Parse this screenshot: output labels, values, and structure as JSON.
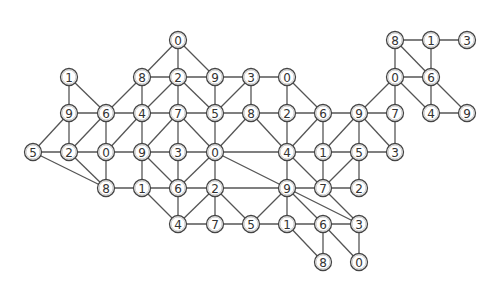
{
  "diagram": {
    "type": "graph",
    "grid": {
      "cols_x": [
        33,
        69,
        106,
        142,
        178,
        215,
        251,
        287,
        323,
        359,
        395,
        431,
        467
      ],
      "rows_y": [
        40,
        77,
        113,
        152,
        188,
        224,
        262
      ]
    },
    "colors": {
      "edge": "#555555",
      "node_stroke": "#444444",
      "node_fill": "#ffffff",
      "label": "#333333"
    },
    "nodes": [
      {
        "id": "r0c4",
        "r": 0,
        "c": 4,
        "label": "0"
      },
      {
        "id": "r0c10",
        "r": 0,
        "c": 10,
        "label": "8"
      },
      {
        "id": "r0c11",
        "r": 0,
        "c": 11,
        "label": "1"
      },
      {
        "id": "r0c12",
        "r": 0,
        "c": 12,
        "label": "3"
      },
      {
        "id": "r1c1",
        "r": 1,
        "c": 1,
        "label": "1"
      },
      {
        "id": "r1c3",
        "r": 1,
        "c": 3,
        "label": "8"
      },
      {
        "id": "r1c4",
        "r": 1,
        "c": 4,
        "label": "2"
      },
      {
        "id": "r1c5",
        "r": 1,
        "c": 5,
        "label": "9"
      },
      {
        "id": "r1c6",
        "r": 1,
        "c": 6,
        "label": "3"
      },
      {
        "id": "r1c7",
        "r": 1,
        "c": 7,
        "label": "0"
      },
      {
        "id": "r1c10",
        "r": 1,
        "c": 10,
        "label": "0"
      },
      {
        "id": "r1c11",
        "r": 1,
        "c": 11,
        "label": "6"
      },
      {
        "id": "r2c1",
        "r": 2,
        "c": 1,
        "label": "9"
      },
      {
        "id": "r2c2",
        "r": 2,
        "c": 2,
        "label": "6"
      },
      {
        "id": "r2c3",
        "r": 2,
        "c": 3,
        "label": "4"
      },
      {
        "id": "r2c4",
        "r": 2,
        "c": 4,
        "label": "7"
      },
      {
        "id": "r2c5",
        "r": 2,
        "c": 5,
        "label": "5"
      },
      {
        "id": "r2c6",
        "r": 2,
        "c": 6,
        "label": "8"
      },
      {
        "id": "r2c7",
        "r": 2,
        "c": 7,
        "label": "2"
      },
      {
        "id": "r2c8",
        "r": 2,
        "c": 8,
        "label": "6"
      },
      {
        "id": "r2c9",
        "r": 2,
        "c": 9,
        "label": "9"
      },
      {
        "id": "r2c10",
        "r": 2,
        "c": 10,
        "label": "7"
      },
      {
        "id": "r2c11",
        "r": 2,
        "c": 11,
        "label": "4"
      },
      {
        "id": "r2c12",
        "r": 2,
        "c": 12,
        "label": "9"
      },
      {
        "id": "r3c0",
        "r": 3,
        "c": 0,
        "label": "5"
      },
      {
        "id": "r3c1",
        "r": 3,
        "c": 1,
        "label": "2"
      },
      {
        "id": "r3c2",
        "r": 3,
        "c": 2,
        "label": "0"
      },
      {
        "id": "r3c3",
        "r": 3,
        "c": 3,
        "label": "9"
      },
      {
        "id": "r3c4",
        "r": 3,
        "c": 4,
        "label": "3"
      },
      {
        "id": "r3c5",
        "r": 3,
        "c": 5,
        "label": "0"
      },
      {
        "id": "r3c7",
        "r": 3,
        "c": 7,
        "label": "4"
      },
      {
        "id": "r3c8",
        "r": 3,
        "c": 8,
        "label": "1"
      },
      {
        "id": "r3c9",
        "r": 3,
        "c": 9,
        "label": "5"
      },
      {
        "id": "r3c10",
        "r": 3,
        "c": 10,
        "label": "3"
      },
      {
        "id": "r4c2",
        "r": 4,
        "c": 2,
        "label": "8"
      },
      {
        "id": "r4c3",
        "r": 4,
        "c": 3,
        "label": "1"
      },
      {
        "id": "r4c4",
        "r": 4,
        "c": 4,
        "label": "6"
      },
      {
        "id": "r4c5",
        "r": 4,
        "c": 5,
        "label": "2"
      },
      {
        "id": "r4c7",
        "r": 4,
        "c": 7,
        "label": "9"
      },
      {
        "id": "r4c8",
        "r": 4,
        "c": 8,
        "label": "7"
      },
      {
        "id": "r4c9",
        "r": 4,
        "c": 9,
        "label": "2"
      },
      {
        "id": "r5c4",
        "r": 5,
        "c": 4,
        "label": "4"
      },
      {
        "id": "r5c5",
        "r": 5,
        "c": 5,
        "label": "7"
      },
      {
        "id": "r5c6",
        "r": 5,
        "c": 6,
        "label": "5"
      },
      {
        "id": "r5c7",
        "r": 5,
        "c": 7,
        "label": "1"
      },
      {
        "id": "r5c8",
        "r": 5,
        "c": 8,
        "label": "6"
      },
      {
        "id": "r5c9",
        "r": 5,
        "c": 9,
        "label": "3"
      },
      {
        "id": "r6c8",
        "r": 6,
        "c": 8,
        "label": "8"
      },
      {
        "id": "r6c9",
        "r": 6,
        "c": 9,
        "label": "0"
      }
    ],
    "edges": [
      [
        "r0c4",
        "r1c3"
      ],
      [
        "r0c4",
        "r1c4"
      ],
      [
        "r0c4",
        "r1c5"
      ],
      [
        "r0c10",
        "r0c11"
      ],
      [
        "r0c11",
        "r0c12"
      ],
      [
        "r0c10",
        "r1c10"
      ],
      [
        "r0c10",
        "r1c11"
      ],
      [
        "r0c11",
        "r1c11"
      ],
      [
        "r1c3",
        "r1c4"
      ],
      [
        "r1c4",
        "r1c5"
      ],
      [
        "r1c5",
        "r1c6"
      ],
      [
        "r1c6",
        "r1c7"
      ],
      [
        "r1c10",
        "r1c11"
      ],
      [
        "r1c1",
        "r2c1"
      ],
      [
        "r1c1",
        "r2c2"
      ],
      [
        "r1c3",
        "r2c2"
      ],
      [
        "r1c3",
        "r2c3"
      ],
      [
        "r1c4",
        "r2c3"
      ],
      [
        "r1c4",
        "r2c4"
      ],
      [
        "r1c4",
        "r2c5"
      ],
      [
        "r1c5",
        "r2c5"
      ],
      [
        "r1c6",
        "r2c5"
      ],
      [
        "r1c6",
        "r2c6"
      ],
      [
        "r1c7",
        "r2c7"
      ],
      [
        "r1c7",
        "r2c8"
      ],
      [
        "r1c10",
        "r2c9"
      ],
      [
        "r1c10",
        "r2c10"
      ],
      [
        "r1c10",
        "r2c11"
      ],
      [
        "r1c11",
        "r2c11"
      ],
      [
        "r1c11",
        "r2c12"
      ],
      [
        "r2c1",
        "r2c2"
      ],
      [
        "r2c2",
        "r2c3"
      ],
      [
        "r2c3",
        "r2c4"
      ],
      [
        "r2c4",
        "r2c5"
      ],
      [
        "r2c5",
        "r2c6"
      ],
      [
        "r2c6",
        "r2c7"
      ],
      [
        "r2c7",
        "r2c8"
      ],
      [
        "r2c8",
        "r2c9"
      ],
      [
        "r2c9",
        "r2c10"
      ],
      [
        "r2c11",
        "r2c12"
      ],
      [
        "r2c1",
        "r3c0"
      ],
      [
        "r2c1",
        "r3c1"
      ],
      [
        "r2c2",
        "r3c1"
      ],
      [
        "r2c2",
        "r3c2"
      ],
      [
        "r2c3",
        "r3c2"
      ],
      [
        "r2c3",
        "r3c3"
      ],
      [
        "r2c4",
        "r3c3"
      ],
      [
        "r2c4",
        "r3c4"
      ],
      [
        "r2c4",
        "r3c5"
      ],
      [
        "r2c5",
        "r3c5"
      ],
      [
        "r2c6",
        "r3c5"
      ],
      [
        "r2c6",
        "r3c7"
      ],
      [
        "r2c7",
        "r3c7"
      ],
      [
        "r2c8",
        "r3c7"
      ],
      [
        "r2c8",
        "r3c8"
      ],
      [
        "r2c9",
        "r3c8"
      ],
      [
        "r2c9",
        "r3c9"
      ],
      [
        "r2c9",
        "r3c10"
      ],
      [
        "r2c10",
        "r3c10"
      ],
      [
        "r3c0",
        "r3c1"
      ],
      [
        "r3c1",
        "r3c2"
      ],
      [
        "r3c2",
        "r3c3"
      ],
      [
        "r3c3",
        "r3c4"
      ],
      [
        "r3c4",
        "r3c5"
      ],
      [
        "r3c5",
        "r3c7"
      ],
      [
        "r3c7",
        "r3c8"
      ],
      [
        "r3c8",
        "r3c9"
      ],
      [
        "r3c9",
        "r3c10"
      ],
      [
        "r3c0",
        "r4c2"
      ],
      [
        "r3c1",
        "r4c2"
      ],
      [
        "r3c2",
        "r4c2"
      ],
      [
        "r3c3",
        "r4c3"
      ],
      [
        "r3c3",
        "r4c4"
      ],
      [
        "r3c4",
        "r4c4"
      ],
      [
        "r3c5",
        "r4c4"
      ],
      [
        "r3c5",
        "r4c5"
      ],
      [
        "r3c5",
        "r4c7"
      ],
      [
        "r3c7",
        "r4c7"
      ],
      [
        "r3c7",
        "r4c8"
      ],
      [
        "r3c8",
        "r4c8"
      ],
      [
        "r3c9",
        "r4c8"
      ],
      [
        "r3c9",
        "r4c9"
      ],
      [
        "r4c2",
        "r4c3"
      ],
      [
        "r4c3",
        "r4c4"
      ],
      [
        "r4c4",
        "r4c5"
      ],
      [
        "r4c5",
        "r4c7"
      ],
      [
        "r4c7",
        "r4c8"
      ],
      [
        "r4c8",
        "r4c9"
      ],
      [
        "r4c3",
        "r5c4"
      ],
      [
        "r4c4",
        "r5c4"
      ],
      [
        "r4c5",
        "r5c4"
      ],
      [
        "r4c5",
        "r5c5"
      ],
      [
        "r4c5",
        "r5c6"
      ],
      [
        "r4c7",
        "r5c6"
      ],
      [
        "r4c7",
        "r5c7"
      ],
      [
        "r4c7",
        "r5c8"
      ],
      [
        "r4c7",
        "r5c9"
      ],
      [
        "r4c8",
        "r5c9"
      ],
      [
        "r5c4",
        "r5c5"
      ],
      [
        "r5c5",
        "r5c6"
      ],
      [
        "r5c6",
        "r5c7"
      ],
      [
        "r5c7",
        "r5c8"
      ],
      [
        "r5c8",
        "r5c9"
      ],
      [
        "r5c7",
        "r6c8"
      ],
      [
        "r5c8",
        "r6c8"
      ],
      [
        "r5c8",
        "r6c9"
      ],
      [
        "r5c9",
        "r6c9"
      ]
    ]
  }
}
